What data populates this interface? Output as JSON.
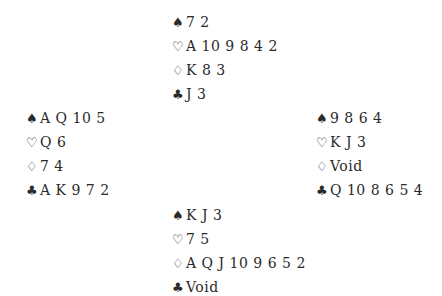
{
  "symbols": {
    "spades": "♠",
    "hearts": "♡",
    "diamonds": "♢",
    "clubs": "♣"
  },
  "hands": {
    "north": {
      "spades": "7 2",
      "hearts": "A 10 9 8 4 2",
      "diamonds": "K 8 3",
      "clubs": "J 3"
    },
    "west": {
      "spades": "A Q 10 5",
      "hearts": "Q 6",
      "diamonds": "7 4",
      "clubs": "A K 9 7 2"
    },
    "east": {
      "spades": "9 8 6 4",
      "hearts": "K J 3",
      "diamonds": "Void",
      "clubs": "Q 10 8 6 5 4"
    },
    "south": {
      "spades": "K J 3",
      "hearts": "7 5",
      "diamonds": "A Q J 10 9 6 5 2",
      "clubs": "Void"
    }
  }
}
